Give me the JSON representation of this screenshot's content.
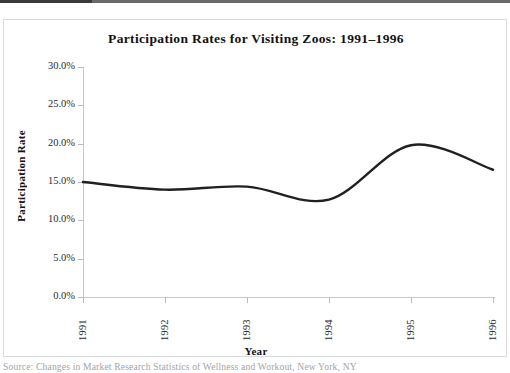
{
  "figure": {
    "title": "Participation Rates for Visiting Zoos: 1991–1996",
    "source_caption": "Source: Changes in Market Research Statistics of Wellness and Workout, New York, NY",
    "line_color": "#231f20",
    "axis_color": "#c7c9cd",
    "frame_color": "#d9dade"
  },
  "chart_data": {
    "type": "line",
    "title": "Participation Rates for Visiting Zoos: 1991–1996",
    "xlabel": "Year",
    "ylabel": "Participation Rate",
    "categories": [
      "1991",
      "1992",
      "1993",
      "1994",
      "1995",
      "1996"
    ],
    "x": [
      1991,
      1992,
      1993,
      1994,
      1995,
      1996
    ],
    "values": [
      15.0,
      14.0,
      14.4,
      12.7,
      19.8,
      16.6
    ],
    "value_labels": [
      "15.0%",
      "14.0%",
      "14.4%",
      "12.7%",
      "19.8%",
      "16.6%"
    ],
    "ylim": [
      0.0,
      30.0
    ],
    "yticks": [
      0.0,
      5.0,
      10.0,
      15.0,
      20.0,
      25.0,
      30.0
    ],
    "ytick_labels": [
      "0.0%",
      "5.0%",
      "10.0%",
      "15.0%",
      "20.0%",
      "25.0%",
      "30.0%"
    ],
    "xtick_labels": [
      "1991",
      "1992",
      "1993",
      "1994",
      "1995",
      "1996"
    ],
    "grid": false,
    "legend": null,
    "smoothing": "spline",
    "series": [
      {
        "name": "Participation Rate",
        "values": [
          15.0,
          14.0,
          14.4,
          12.7,
          19.8,
          16.6
        ]
      }
    ]
  }
}
